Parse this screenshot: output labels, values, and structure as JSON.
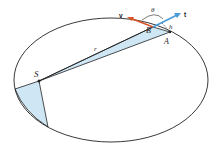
{
  "diagram": {
    "labels": {
      "S": "S",
      "B": "B",
      "A": "A",
      "r": "r",
      "h": "h",
      "theta": "θ",
      "v": "v",
      "t": "t"
    },
    "colors": {
      "orbit": "#222222",
      "fill": "#cfe6f5",
      "v_vector": "#d9532b",
      "t_vector": "#4a9bd6"
    }
  }
}
